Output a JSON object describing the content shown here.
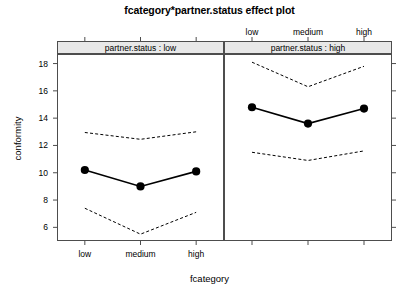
{
  "chart_data": {
    "type": "line",
    "title": "fcategory*partner.status effect plot",
    "xlabel": "fcategory",
    "ylabel": "conformity",
    "categories": [
      "low",
      "medium",
      "high"
    ],
    "xtick_labels": [
      "low",
      "medium",
      "high"
    ],
    "ytick_labels": [
      "6",
      "8",
      "10",
      "12",
      "14",
      "16",
      "18"
    ],
    "ytick_values": [
      6,
      8,
      10,
      12,
      14,
      16,
      18
    ],
    "ylim": [
      5.0,
      18.7
    ],
    "xlim": [
      0.5,
      3.5
    ],
    "grid": false,
    "legend": false,
    "panel_variable": "partner.status",
    "panels": [
      {
        "strip_label": "partner.status : low",
        "level": "low",
        "fit": [
          10.2,
          9.0,
          10.1
        ],
        "lower": [
          7.4,
          5.5,
          7.1
        ],
        "upper": [
          12.95,
          12.45,
          13.0
        ],
        "show_bottom_axis_labels": true,
        "show_top_axis_labels": false
      },
      {
        "strip_label": "partner.status : high",
        "level": "high",
        "fit": [
          14.8,
          13.6,
          14.7
        ],
        "lower": [
          11.5,
          10.9,
          11.6
        ],
        "upper": [
          18.1,
          16.3,
          17.8
        ],
        "show_bottom_axis_labels": false,
        "show_top_axis_labels": true
      }
    ],
    "series_roles": [
      {
        "name": "fit",
        "style": "solid-line-with-points"
      },
      {
        "name": "lower confidence bound",
        "style": "dashed-line"
      },
      {
        "name": "upper confidence bound",
        "style": "dashed-line"
      }
    ],
    "colors": {
      "line": "#000000",
      "point": "#000000",
      "confidence": "#000000",
      "strip_background": "#e8e8e8",
      "frame": "#4d4d4d",
      "background": "#ffffff"
    }
  }
}
